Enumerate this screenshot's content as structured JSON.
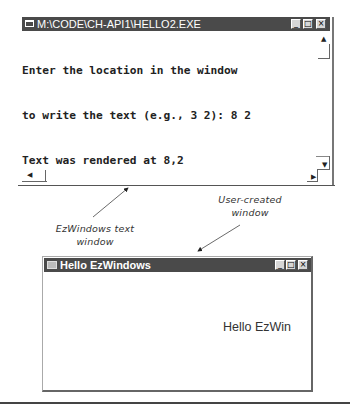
{
  "console_window": {
    "title": "M:\\CODE\\CH-API1\\HELLO2.EXE",
    "title_buttons": {
      "minimize": "_",
      "maximize": "□",
      "close": "×"
    },
    "lines": [
      "Enter the location in the window",
      "to write the text (e.g., 3 2): 8 2",
      "Text was rendered at 8,2"
    ],
    "scrollbar_glyphs": {
      "up": "▲",
      "down": "▼",
      "left": "◀",
      "right": "▶"
    }
  },
  "user_window": {
    "title": "Hello EzWindows",
    "title_buttons": {
      "minimize": "_",
      "maximize": "□",
      "close": "×"
    },
    "content_text": "Hello EzWin"
  },
  "annotations": {
    "text_window_label_line1": "EzWindows text",
    "text_window_label_line2": "window",
    "user_window_label_line1": "User-created",
    "user_window_label_line2": "window"
  },
  "colors": {
    "titlebar": "#4a4a4a",
    "titlebar_text": "#ffffff",
    "console_text": "#222222",
    "background": "#ffffff"
  }
}
